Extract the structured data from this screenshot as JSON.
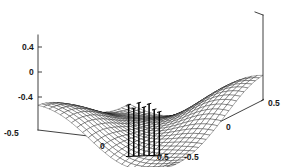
{
  "figure": {
    "title": "",
    "background_color": "#ffffff",
    "line_color": "#111111",
    "axis_color": "#2b2b2b",
    "width_px": 294,
    "height_px": 167
  },
  "chart_data": {
    "type": "surface",
    "title": "",
    "xlabel": "",
    "ylabel": "",
    "zlabel": "",
    "grid": false,
    "legend": null,
    "projection": "3d",
    "view": {
      "azimuth": -37.5,
      "elevation": 30
    },
    "mesh_style": "wireframe",
    "x_axis": {
      "name": "x",
      "ticks": [
        -0.5,
        0,
        0.5
      ],
      "tick_labels": [
        "-0.5",
        "0",
        "0.5"
      ],
      "lim": [
        -0.5,
        0.5
      ]
    },
    "y_axis": {
      "name": "y",
      "ticks": [
        -0.5,
        0,
        0.5
      ],
      "tick_labels": [
        "-0.5",
        "0",
        "0.5"
      ],
      "lim": [
        -0.5,
        0.5
      ]
    },
    "z_axis": {
      "name": "z",
      "ticks": [
        -0.4,
        0,
        0.4
      ],
      "tick_labels": [
        "-0.4",
        "0",
        "0.4"
      ],
      "lim": [
        -0.6,
        0.55
      ]
    },
    "surface": {
      "description": "Smooth saddle/wave surface: high ridges at the left-back and right-back corners, deep valley running through the centre toward the front corner.",
      "grid_n_x": 24,
      "grid_n_y": 24,
      "z_min": -0.55,
      "z_max": 0.52,
      "sample_heights": {
        "corner_back_left": 0.48,
        "corner_back_right": 0.52,
        "corner_front_left": -0.3,
        "corner_front_right": -0.1,
        "centre": -0.18,
        "valley_minimum": -0.55
      }
    },
    "overlay": {
      "type": "stem",
      "description": "Cluster of thin vertical stems (impulse/needle markers) rising from the valley floor near the centre of the domain.",
      "count": 7,
      "x_positions": [
        0.05,
        0.09,
        0.13,
        0.17,
        0.21,
        0.25,
        0.29
      ],
      "base_z": -0.52,
      "tip_heights": [
        0.3,
        0.24,
        0.33,
        0.26,
        0.31,
        0.22,
        0.18
      ]
    }
  },
  "axes": {
    "z_ticks": [
      {
        "label": "0.4",
        "x": 22,
        "y": 47
      },
      {
        "label": "0",
        "x": 29,
        "y": 72
      },
      {
        "label": "-0.4",
        "x": 20,
        "y": 97
      }
    ],
    "x_ticks": [
      {
        "label": "-0.5",
        "x": 16,
        "y": 133
      },
      {
        "label": "0",
        "x": 103,
        "y": 146
      },
      {
        "label": "0.5",
        "x": 163,
        "y": 157
      }
    ],
    "y_ticks": [
      {
        "label": "-0.5",
        "x": 190,
        "y": 157
      },
      {
        "label": "0",
        "x": 229,
        "y": 127
      },
      {
        "label": "0.5",
        "x": 272,
        "y": 103
      }
    ]
  }
}
